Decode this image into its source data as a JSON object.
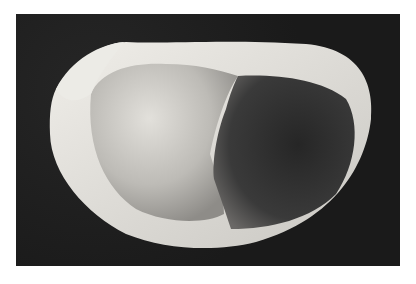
{
  "image": {
    "subject": "bivalve shell interior view",
    "background_color": "#1c1c1c",
    "colors": {
      "shell_rim": "#e4e2dc",
      "inner_light": "#cfcdc8",
      "inner_dark": "#2e2e2e"
    }
  }
}
